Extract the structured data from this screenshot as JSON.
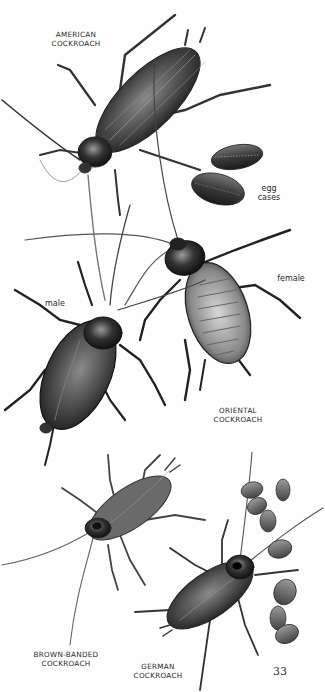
{
  "page": {
    "number": "33",
    "background": "#fefefe",
    "ink_color": "#2a2a2a"
  },
  "illustrations": [
    {
      "name": "american-cockroach",
      "label_lines": [
        "AMERICAN",
        "COCKROACH"
      ]
    },
    {
      "name": "egg-cases-american",
      "label_lines": [
        "egg",
        "cases"
      ]
    },
    {
      "name": "oriental-cockroach-female",
      "sublabel": "female"
    },
    {
      "name": "oriental-cockroach-male",
      "sublabel": "male"
    },
    {
      "name": "oriental-cockroach",
      "label_lines": [
        "ORIENTAL",
        "COCKROACH"
      ]
    },
    {
      "name": "brown-banded-cockroach",
      "label_lines": [
        "BROWN-BANDED",
        "COCKROACH"
      ]
    },
    {
      "name": "german-cockroach",
      "label_lines": [
        "GERMAN",
        "COCKROACH"
      ]
    }
  ],
  "labels": {
    "american": {
      "line1": "AMERICAN",
      "line2": "COCKROACH"
    },
    "egg_cases": {
      "line1": "egg",
      "line2": "cases"
    },
    "female": "female",
    "male": "male",
    "oriental": {
      "line1": "ORIENTAL",
      "line2": "COCKROACH"
    },
    "brown_banded": {
      "line1": "BROWN-BANDED",
      "line2": "COCKROACH"
    },
    "german": {
      "line1": "GERMAN",
      "line2": "COCKROACH"
    }
  }
}
